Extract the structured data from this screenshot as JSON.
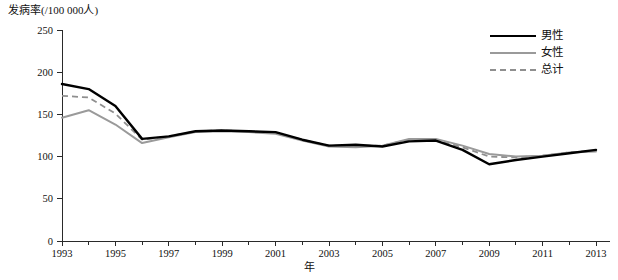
{
  "chart_data": {
    "type": "line",
    "title": "",
    "ylabel": "发病率(/100 000人)",
    "xlabel": "年",
    "ylim": [
      0,
      250
    ],
    "yticks": [
      0,
      50,
      100,
      150,
      200,
      250
    ],
    "ytick_labels": [
      "0",
      "50",
      "100",
      "150",
      "200",
      "250"
    ],
    "xlim": [
      1993,
      2013
    ],
    "x": [
      1993,
      1994,
      1995,
      1996,
      1997,
      1998,
      1999,
      2000,
      2001,
      2002,
      2003,
      2004,
      2005,
      2006,
      2007,
      2008,
      2009,
      2010,
      2011,
      2012,
      2013
    ],
    "xticks": [
      1993,
      1994,
      1995,
      1996,
      1997,
      1998,
      1999,
      2000,
      2001,
      2002,
      2003,
      2004,
      2005,
      2006,
      2007,
      2008,
      2009,
      2010,
      2011,
      2012,
      2013
    ],
    "xtick_labels": [
      "1993",
      "",
      "1995",
      "",
      "1997",
      "",
      "1999",
      "",
      "2001",
      "",
      "2003",
      "",
      "2005",
      "",
      "2007",
      "",
      "2009",
      "",
      "2011",
      "",
      "2013"
    ],
    "grid": false,
    "legend_position": "top-right",
    "series": [
      {
        "name": "男性",
        "style": "solid",
        "color": "#000000",
        "values": [
          186,
          180,
          160,
          121,
          124,
          130,
          131,
          130,
          129,
          120,
          113,
          114,
          112,
          118,
          119,
          108,
          91,
          96,
          100,
          104,
          108
        ]
      },
      {
        "name": "女性",
        "style": "solid",
        "color": "#9a9a9a",
        "values": [
          146,
          155,
          138,
          116,
          123,
          129,
          130,
          129,
          127,
          119,
          112,
          111,
          113,
          121,
          121,
          113,
          103,
          100,
          101,
          105,
          106
        ]
      },
      {
        "name": "总计",
        "style": "dashed",
        "color": "#8f8f8f",
        "values": [
          172,
          170,
          151,
          120,
          124,
          130,
          131,
          130,
          128,
          120,
          113,
          113,
          113,
          120,
          120,
          111,
          100,
          99,
          101,
          105,
          107
        ]
      }
    ]
  },
  "legend": {
    "items": [
      {
        "label": "男性"
      },
      {
        "label": "女性"
      },
      {
        "label": "总计"
      }
    ]
  }
}
